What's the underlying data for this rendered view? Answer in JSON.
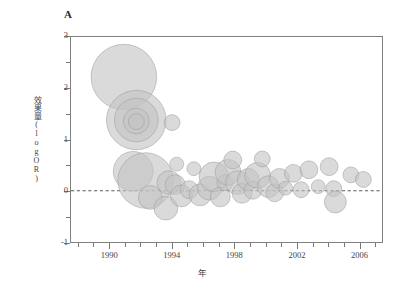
{
  "figure": {
    "panel_label": "A",
    "background_color": "#ffffff"
  },
  "chart_data": {
    "type": "scatter",
    "title": "A",
    "xlabel": "年",
    "ylabel": "效果量(logOR)",
    "xlim": [
      1987.5,
      2007.5
    ],
    "ylim": [
      -1,
      3
    ],
    "xticks": [
      1990,
      1994,
      1998,
      2002,
      2006
    ],
    "xticklabels": [
      "1990",
      "1994",
      "1998",
      "2002",
      "2006"
    ],
    "xminor_ticks": [
      1988,
      1989,
      1991,
      1992,
      1993,
      1995,
      1996,
      1997,
      1999,
      2000,
      2001,
      2003,
      2004,
      2005,
      2007
    ],
    "yticks": [
      -1,
      0,
      1,
      2,
      3
    ],
    "yticklabels": [
      "-1",
      "0",
      "1",
      "2",
      "3"
    ],
    "yminor_ticks": [
      -0.5,
      0.5,
      1.5,
      2.5
    ],
    "grid": false,
    "legend": null,
    "reference_line": {
      "type": "hline",
      "value": 0,
      "style": "dashed",
      "color": "#444444"
    },
    "marker": {
      "shape": "circle",
      "fill_color": "#c4c4c4",
      "edge_color": "#9a9a9a",
      "opacity": 0.62,
      "size_meaning": "study weight / precision"
    },
    "size_scale": {
      "radius_min_px": 5,
      "radius_max_px": 34
    },
    "points": [
      {
        "x": 1990.9,
        "y": 2.22,
        "r": 33
      },
      {
        "x": 1991.7,
        "y": 1.38,
        "r": 30
      },
      {
        "x": 1991.7,
        "y": 1.38,
        "r": 22
      },
      {
        "x": 1991.7,
        "y": 1.36,
        "r": 13
      },
      {
        "x": 1991.7,
        "y": 1.35,
        "r": 8
      },
      {
        "x": 1994.0,
        "y": 1.33,
        "r": 8
      },
      {
        "x": 1991.5,
        "y": 0.38,
        "r": 20
      },
      {
        "x": 1992.3,
        "y": 0.2,
        "r": 28
      },
      {
        "x": 1992.6,
        "y": -0.13,
        "r": 12
      },
      {
        "x": 1993.6,
        "y": -0.34,
        "r": 12
      },
      {
        "x": 1993.8,
        "y": 0.16,
        "r": 12
      },
      {
        "x": 1994.2,
        "y": 0.12,
        "r": 10
      },
      {
        "x": 1994.3,
        "y": 0.52,
        "r": 7
      },
      {
        "x": 1994.6,
        "y": -0.1,
        "r": 11
      },
      {
        "x": 1995.1,
        "y": 0.02,
        "r": 9
      },
      {
        "x": 1995.4,
        "y": 0.43,
        "r": 7
      },
      {
        "x": 1995.8,
        "y": -0.08,
        "r": 11
      },
      {
        "x": 1996.4,
        "y": 0.05,
        "r": 12
      },
      {
        "x": 1996.7,
        "y": 0.27,
        "r": 15
      },
      {
        "x": 1997.1,
        "y": -0.12,
        "r": 10
      },
      {
        "x": 1997.4,
        "y": 0.16,
        "r": 8
      },
      {
        "x": 1997.6,
        "y": 0.36,
        "r": 13
      },
      {
        "x": 1997.9,
        "y": 0.6,
        "r": 9
      },
      {
        "x": 1998.2,
        "y": 0.16,
        "r": 12
      },
      {
        "x": 1998.5,
        "y": -0.05,
        "r": 10
      },
      {
        "x": 1998.9,
        "y": 0.22,
        "r": 11
      },
      {
        "x": 1999.2,
        "y": 0.01,
        "r": 9
      },
      {
        "x": 1999.5,
        "y": 0.3,
        "r": 13
      },
      {
        "x": 1999.8,
        "y": 0.62,
        "r": 8
      },
      {
        "x": 2000.2,
        "y": 0.08,
        "r": 11
      },
      {
        "x": 2000.6,
        "y": -0.04,
        "r": 9
      },
      {
        "x": 2000.9,
        "y": 0.24,
        "r": 10
      },
      {
        "x": 2001.3,
        "y": 0.05,
        "r": 7
      },
      {
        "x": 2001.8,
        "y": 0.34,
        "r": 9
      },
      {
        "x": 2002.3,
        "y": 0.02,
        "r": 8
      },
      {
        "x": 2002.8,
        "y": 0.41,
        "r": 9
      },
      {
        "x": 2003.4,
        "y": 0.08,
        "r": 7
      },
      {
        "x": 2004.1,
        "y": 0.47,
        "r": 9
      },
      {
        "x": 2004.4,
        "y": 0.04,
        "r": 8
      },
      {
        "x": 2004.5,
        "y": -0.22,
        "r": 11
      },
      {
        "x": 2005.5,
        "y": 0.31,
        "r": 8
      },
      {
        "x": 2006.3,
        "y": 0.22,
        "r": 8
      }
    ]
  }
}
